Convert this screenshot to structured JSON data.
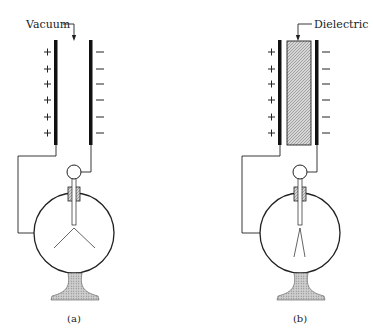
{
  "figure": {
    "panels": [
      {
        "id": "a",
        "caption": "(a)",
        "gap_label": "Vacuum",
        "left_plate_charge": "+",
        "right_plate_charge": "−",
        "charge_count_per_plate": 6,
        "leaf_state": "widely diverged"
      },
      {
        "id": "b",
        "caption": "(b)",
        "gap_label": "Dielectric",
        "left_plate_charge": "+",
        "right_plate_charge": "−",
        "charge_count_per_plate": 6,
        "leaf_state": "slightly diverged"
      }
    ]
  },
  "colors": {
    "ink": "#222222",
    "hatch_fill": "#c8c8c8",
    "background": "#ffffff"
  }
}
